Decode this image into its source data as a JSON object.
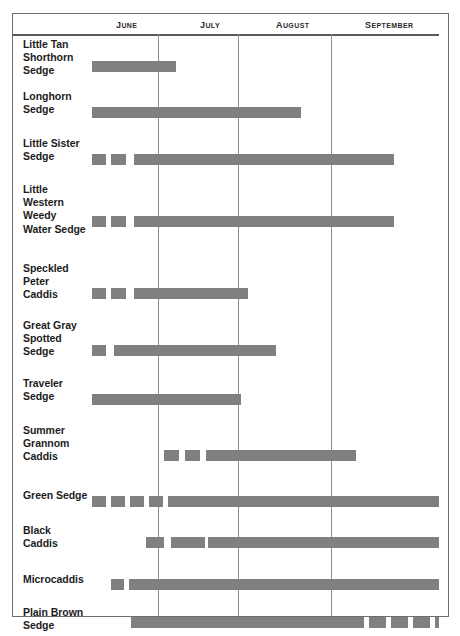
{
  "chart_data": {
    "type": "bar",
    "title": "",
    "subtitle": "",
    "xlabel": "",
    "ylabel": "",
    "grid": true,
    "legend_position": "none",
    "bar_color": "#808080",
    "axis_months": [
      "June",
      "July",
      "August",
      "September"
    ],
    "month_boundaries_px": [
      157,
      237,
      330
    ],
    "plot_x_range_px": [
      91,
      438
    ],
    "categories": [
      "Little Tan Shorthorn Sedge",
      "Longhorn Sedge",
      "Little Sister Sedge",
      "Little Western Weedy Water Sedge",
      "Speckled Peter Caddis",
      "Great Gray Spotted Sedge",
      "Traveler Sedge",
      "Summer Grannom Caddis",
      "Green Sedge",
      "Black Caddis",
      "Microcaddis",
      "Plain Brown Sedge"
    ],
    "rows": [
      {
        "label_lines": [
          "Little Tan",
          "Shorthorn",
          "Sedge"
        ],
        "label_top": 4,
        "bar_top": 27,
        "row_height": 52,
        "segments": [
          {
            "x": 91,
            "w": 84
          }
        ]
      },
      {
        "label_lines": [
          "Longhorn",
          "Sedge"
        ],
        "label_top": 56,
        "bar_top": 73,
        "row_height": 47,
        "segments": [
          {
            "x": 91,
            "w": 209
          }
        ]
      },
      {
        "label_lines": [
          "Little Sister",
          "Sedge"
        ],
        "label_top": 103,
        "bar_top": 120,
        "row_height": 46,
        "segments": [
          {
            "x": 91,
            "w": 14
          },
          {
            "x": 110,
            "w": 15
          },
          {
            "x": 133,
            "w": 260
          }
        ]
      },
      {
        "label_lines": [
          "Little",
          "Western",
          "Weedy",
          "Water Sedge"
        ],
        "label_top": 149,
        "bar_top": 182,
        "row_height": 66,
        "segments": [
          {
            "x": 91,
            "w": 14
          },
          {
            "x": 110,
            "w": 15
          },
          {
            "x": 133,
            "w": 260
          }
        ]
      },
      {
        "label_lines": [
          "Speckled",
          "Peter",
          "Caddis"
        ],
        "label_top": 228,
        "bar_top": 254,
        "row_height": 55,
        "segments": [
          {
            "x": 91,
            "w": 14
          },
          {
            "x": 110,
            "w": 15
          },
          {
            "x": 133,
            "w": 114
          }
        ]
      },
      {
        "label_lines": [
          "Great Gray",
          "Spotted",
          "Sedge"
        ],
        "label_top": 285,
        "bar_top": 311,
        "row_height": 55,
        "segments": [
          {
            "x": 91,
            "w": 14
          },
          {
            "x": 113,
            "w": 162
          }
        ]
      },
      {
        "label_lines": [
          "Traveler",
          "Sedge"
        ],
        "label_top": 343,
        "bar_top": 360,
        "row_height": 48,
        "segments": [
          {
            "x": 91,
            "w": 149
          }
        ]
      },
      {
        "label_lines": [
          "Summer",
          "Grannom",
          "Caddis"
        ],
        "label_top": 390,
        "bar_top": 416,
        "row_height": 56,
        "segments": [
          {
            "x": 163,
            "w": 15
          },
          {
            "x": 184,
            "w": 15
          },
          {
            "x": 205,
            "w": 150
          }
        ]
      },
      {
        "label_lines": [
          "Green Sedge"
        ],
        "label_top": 455,
        "bar_top": 462,
        "row_height": 35,
        "segments": [
          {
            "x": 91,
            "w": 14
          },
          {
            "x": 110,
            "w": 14
          },
          {
            "x": 129,
            "w": 14
          },
          {
            "x": 148,
            "w": 14
          },
          {
            "x": 167,
            "w": 14
          },
          {
            "x": 177,
            "w": 261
          }
        ]
      },
      {
        "label_lines": [
          "Black",
          "Caddis"
        ],
        "label_top": 490,
        "bar_top": 503,
        "row_height": 43,
        "segments": [
          {
            "x": 145,
            "w": 18
          },
          {
            "x": 170,
            "w": 18
          },
          {
            "x": 186,
            "w": 18
          },
          {
            "x": 207,
            "w": 231
          }
        ]
      },
      {
        "label_lines": [
          "Microcaddis"
        ],
        "label_top": 539,
        "bar_top": 545,
        "row_height": 35,
        "segments": [
          {
            "x": 110,
            "w": 13
          },
          {
            "x": 128,
            "w": 310
          }
        ]
      },
      {
        "label_lines": [
          "Plain Brown",
          "Sedge"
        ],
        "label_top": 572,
        "bar_top": 583,
        "row_height": 40,
        "segments": [
          {
            "x": 130,
            "w": 233
          },
          {
            "x": 368,
            "w": 17
          },
          {
            "x": 390,
            "w": 17
          },
          {
            "x": 412,
            "w": 17
          },
          {
            "x": 434,
            "w": 4
          }
        ]
      }
    ]
  },
  "header": {
    "months": [
      {
        "label": "June",
        "left": 103
      },
      {
        "label": "July",
        "left": 187
      },
      {
        "label": "August",
        "left": 263
      },
      {
        "label": "September",
        "left": 352
      }
    ]
  }
}
